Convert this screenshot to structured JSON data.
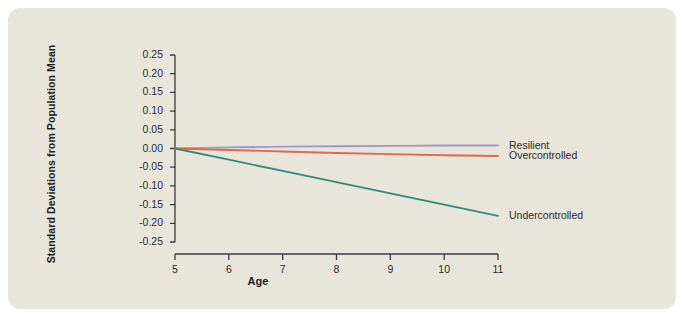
{
  "figure": {
    "background_color": "#e8e6da",
    "page_color": "#ffffff"
  },
  "chart_data": {
    "type": "line",
    "title": "",
    "xlabel": "Age",
    "ylabel": "Standard Deviations from Population Mean",
    "x": [
      5,
      6,
      7,
      8,
      9,
      10,
      11
    ],
    "xlim": [
      5,
      11
    ],
    "ylim": [
      -0.25,
      0.25
    ],
    "xticks": [
      5,
      6,
      7,
      8,
      9,
      10,
      11
    ],
    "xtick_labels": [
      "5",
      "6",
      "7",
      "8",
      "9",
      "10",
      "11"
    ],
    "yticks": [
      0.25,
      0.2,
      0.15,
      0.1,
      0.05,
      0,
      -0.05,
      -0.1,
      -0.15,
      -0.2,
      -0.25
    ],
    "ytick_labels": [
      "0.25",
      "0.20",
      "0.15",
      "0.10",
      "0.05",
      "0.00",
      "-0.05",
      "-0.10",
      "-0.15",
      "-0.20",
      "-0.25"
    ],
    "grid": false,
    "legend_position": "right-inline",
    "series": [
      {
        "name": "Resilient",
        "color": "#9e99c6",
        "values": [
          0.0,
          0.003,
          0.005,
          0.006,
          0.007,
          0.008,
          0.008
        ],
        "label_value": "0.01"
      },
      {
        "name": "Overcontrolled",
        "color": "#e0694a",
        "values": [
          0.0,
          -0.004,
          -0.008,
          -0.012,
          -0.015,
          -0.018,
          -0.02
        ],
        "label_value": "-0.02"
      },
      {
        "name": "Undercontrolled",
        "color": "#2e8b7a",
        "values": [
          0.0,
          -0.03,
          -0.06,
          -0.09,
          -0.12,
          -0.15,
          -0.18
        ],
        "label_value": "-0.18"
      }
    ]
  },
  "axis": {
    "line_color": "#3a3a3a"
  }
}
